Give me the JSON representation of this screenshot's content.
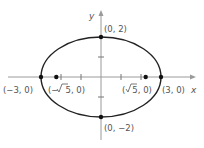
{
  "diagram": {
    "type": "ellipse-on-axes",
    "equation": "x^2/9 + y^2/4 = 1",
    "colors": {
      "axis": "#9a9a9a",
      "curve": "#222222",
      "point": "#111111",
      "label": "#555555"
    },
    "axes": {
      "x_label": "x",
      "y_label": "y"
    },
    "points": [
      {
        "id": "top-vertex",
        "label": "(0, 2)"
      },
      {
        "id": "bottom-vertex",
        "label": "(0, −2)"
      },
      {
        "id": "left-vertex",
        "label": "(−3, 0)"
      },
      {
        "id": "right-vertex",
        "label": "(3, 0)"
      },
      {
        "id": "left-focus",
        "label_prefix": "(−",
        "label_root": "5",
        "label_suffix": ", 0)"
      },
      {
        "id": "right-focus",
        "label_prefix": "(",
        "label_root": "5",
        "label_suffix": ", 0)"
      }
    ]
  }
}
